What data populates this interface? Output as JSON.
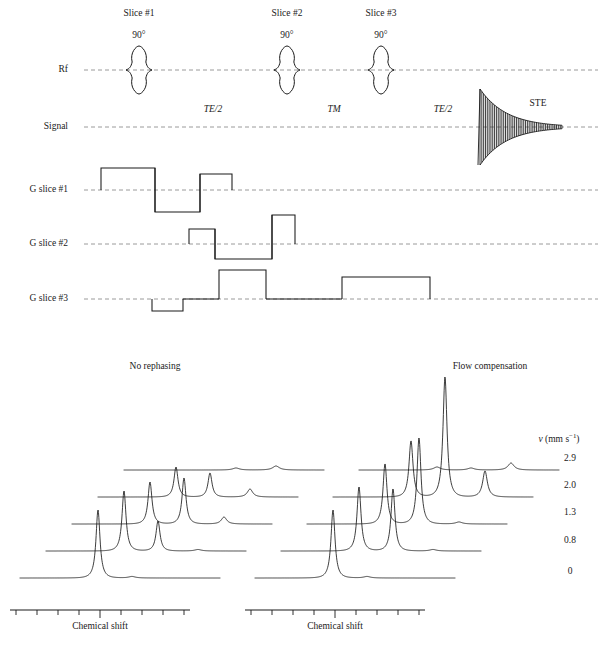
{
  "figure": {
    "ink_color": "#1a1a1a",
    "baseline_color": "#808080"
  },
  "sequence_diagram": {
    "row_labels": [
      {
        "id": "rf",
        "text": "Rf",
        "y": 70
      },
      {
        "id": "signal",
        "text": "Signal",
        "y": 127
      },
      {
        "id": "g-slice-1",
        "text": "G slice #1",
        "y": 190
      },
      {
        "id": "g-slice-2",
        "text": "G slice #2",
        "y": 244
      },
      {
        "id": "g-slice-3",
        "text": "G slice #3",
        "y": 299
      }
    ],
    "slice_titles": [
      {
        "text": "Slice #1",
        "x": 139,
        "y": 14
      },
      {
        "text": "Slice #2",
        "x": 287,
        "y": 14
      },
      {
        "text": "Slice #3",
        "x": 381,
        "y": 14
      }
    ],
    "flip_angles": [
      {
        "text": "90°",
        "x": 139,
        "y": 36
      },
      {
        "text": "90°",
        "x": 287,
        "y": 36
      },
      {
        "text": "90°",
        "x": 381,
        "y": 36
      }
    ],
    "interval_labels": [
      {
        "text": "TE/2",
        "x": 213,
        "y": 110,
        "italic": true
      },
      {
        "text": "TM",
        "x": 334,
        "y": 110,
        "italic": true
      },
      {
        "text": "TE/2",
        "x": 443,
        "y": 110,
        "italic": true
      }
    ],
    "echo_label": {
      "text": "STE",
      "x": 538,
      "y": 104
    },
    "rf_pulses": [
      {
        "center_x": 139,
        "half_width": 13,
        "amplitude": 24
      },
      {
        "center_x": 287,
        "half_width": 13,
        "amplitude": 24
      },
      {
        "center_x": 381,
        "half_width": 13,
        "amplitude": 24
      }
    ],
    "echo": {
      "start_x": 478,
      "peak_x": 480,
      "end_x": 562,
      "max_amplitude": 38,
      "oscillations": 46
    },
    "gradients": {
      "g_slice_1": [
        {
          "x0": 101,
          "x1": 155,
          "height": 22
        },
        {
          "x0": 155,
          "x1": 200,
          "height": -22
        },
        {
          "x0": 200,
          "x1": 232,
          "height": 16
        }
      ],
      "g_slice_2": [
        {
          "x0": 189,
          "x1": 215,
          "height": 15
        },
        {
          "x0": 215,
          "x1": 272,
          "height": -15
        },
        {
          "x0": 272,
          "x1": 295,
          "height": 29
        }
      ],
      "g_slice_3": [
        {
          "x0": 152,
          "x1": 183,
          "height": -12
        },
        {
          "x0": 219,
          "x1": 266,
          "height": 29
        },
        {
          "x0": 342,
          "x1": 430,
          "height": 22
        }
      ]
    },
    "baselines": {
      "x0": 84,
      "x1": 598
    }
  },
  "spectra": {
    "panel_titles": [
      {
        "id": "left-panel-title",
        "text": "No rephasing",
        "x": 155,
        "y": 367
      },
      {
        "id": "right-panel-title",
        "text": "Flow compensation",
        "x": 490,
        "y": 367
      }
    ],
    "velocity_header": {
      "text_prefix": "v",
      "text_unit": "(mm s",
      "exponent": "−1",
      "text_suffix": ")",
      "x": 559,
      "y": 440
    },
    "velocity_labels": [
      {
        "value": "2.9",
        "x": 570,
        "y": 459
      },
      {
        "value": "2.0",
        "x": 570,
        "y": 486
      },
      {
        "value": "1.3",
        "x": 570,
        "y": 513
      },
      {
        "value": "0.8",
        "x": 570,
        "y": 541
      },
      {
        "value": "0",
        "x": 570,
        "y": 572
      }
    ],
    "axis_label_left": {
      "text": "Chemical shift",
      "x": 100,
      "y": 627
    },
    "axis_label_right": {
      "text": "Chemical shift",
      "x": 335,
      "y": 627
    },
    "axes": [
      {
        "id": "left-chemical-shift-axis",
        "x0": 10,
        "x1": 190,
        "y": 610,
        "ticks": 9
      },
      {
        "id": "right-chemical-shift-axis",
        "x0": 245,
        "x1": 425,
        "y": 610,
        "ticks": 9
      }
    ],
    "traces_note": "Five stacked spectra per panel, offset upward and rightward with increasing flow velocity."
  },
  "chart_data": {
    "type": "line",
    "xlabel": "Chemical shift",
    "ylabel": "Signal intensity (stacked, arbitrary units)",
    "series_axis": "v (mm s−1)",
    "panels": [
      {
        "name": "No rephasing",
        "origin_x": 20,
        "origin_y": 578,
        "trace_width": 200,
        "x_step": 26,
        "y_step": 27,
        "traces": [
          {
            "velocity": "0",
            "offset_index": 0,
            "peaks": [
              {
                "center": 0.39,
                "height": 68,
                "width": 0.012
              },
              {
                "center": 0.56,
                "height": 1.5,
                "width": 0.02
              }
            ]
          },
          {
            "velocity": "0.8",
            "offset_index": 1,
            "peaks": [
              {
                "center": 0.39,
                "height": 60,
                "width": 0.012
              },
              {
                "center": 0.56,
                "height": 30,
                "width": 0.012
              },
              {
                "center": 0.76,
                "height": 1.5,
                "width": 0.02
              }
            ]
          },
          {
            "velocity": "1.3",
            "offset_index": 2,
            "peaks": [
              {
                "center": 0.39,
                "height": 42,
                "width": 0.012
              },
              {
                "center": 0.56,
                "height": 46,
                "width": 0.012
              },
              {
                "center": 0.76,
                "height": 7,
                "width": 0.016
              }
            ]
          },
          {
            "velocity": "2.0",
            "offset_index": 3,
            "peaks": [
              {
                "center": 0.39,
                "height": 30,
                "width": 0.012
              },
              {
                "center": 0.56,
                "height": 24,
                "width": 0.012
              },
              {
                "center": 0.76,
                "height": 8,
                "width": 0.016
              }
            ]
          },
          {
            "velocity": "2.9",
            "offset_index": 4,
            "peaks": [
              {
                "center": 0.56,
                "height": 2,
                "width": 0.02
              },
              {
                "center": 0.76,
                "height": 4,
                "width": 0.02
              }
            ]
          }
        ]
      },
      {
        "name": "Flow compensation",
        "origin_x": 255,
        "origin_y": 578,
        "trace_width": 200,
        "x_step": 26,
        "y_step": 27,
        "traces": [
          {
            "velocity": "0",
            "offset_index": 0,
            "peaks": [
              {
                "center": 0.39,
                "height": 68,
                "width": 0.012
              },
              {
                "center": 0.56,
                "height": 1.5,
                "width": 0.02
              }
            ]
          },
          {
            "velocity": "0.8",
            "offset_index": 1,
            "peaks": [
              {
                "center": 0.39,
                "height": 64,
                "width": 0.012
              },
              {
                "center": 0.56,
                "height": 62,
                "width": 0.012
              },
              {
                "center": 0.76,
                "height": 1.5,
                "width": 0.02
              }
            ]
          },
          {
            "velocity": "1.3",
            "offset_index": 2,
            "peaks": [
              {
                "center": 0.39,
                "height": 60,
                "width": 0.012
              },
              {
                "center": 0.56,
                "height": 86,
                "width": 0.012
              },
              {
                "center": 0.76,
                "height": 2,
                "width": 0.02
              }
            ]
          },
          {
            "velocity": "2.0",
            "offset_index": 3,
            "peaks": [
              {
                "center": 0.39,
                "height": 56,
                "width": 0.012
              },
              {
                "center": 0.56,
                "height": 120,
                "width": 0.012
              },
              {
                "center": 0.76,
                "height": 26,
                "width": 0.014
              }
            ]
          },
          {
            "velocity": "2.9",
            "offset_index": 4,
            "peaks": [
              {
                "center": 0.39,
                "height": 3,
                "width": 0.02
              },
              {
                "center": 0.56,
                "height": 2,
                "width": 0.02
              },
              {
                "center": 0.76,
                "height": 7,
                "width": 0.018
              }
            ]
          }
        ]
      }
    ]
  }
}
